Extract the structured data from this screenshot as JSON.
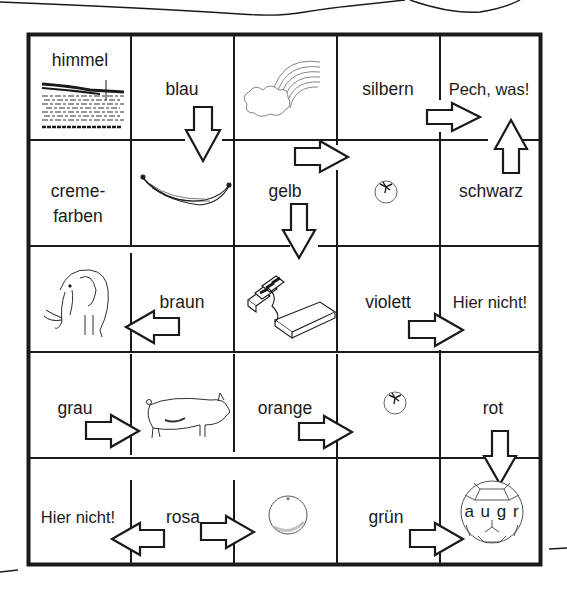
{
  "worksheet": {
    "grid": {
      "rows": 5,
      "cols": 5,
      "cells": [
        [
          {
            "label": "himmel",
            "picture": "water-landscape"
          },
          {
            "label": "blau",
            "picture": null
          },
          {
            "label": null,
            "picture": "rainbow-cloud"
          },
          {
            "label": "silbern",
            "picture": null
          },
          {
            "label": "Pech, was!",
            "picture": null
          }
        ],
        [
          {
            "label": "creme-\nfarben",
            "picture": null
          },
          {
            "label": null,
            "picture": "banana"
          },
          {
            "label": "gelb",
            "picture": null
          },
          {
            "label": null,
            "picture": "tomato"
          },
          {
            "label": "schwarz",
            "picture": null
          }
        ],
        [
          {
            "label": null,
            "picture": "elephant"
          },
          {
            "label": "braun",
            "picture": null
          },
          {
            "label": null,
            "picture": "chocolate-bar"
          },
          {
            "label": "violett",
            "picture": null
          },
          {
            "label": "Hier nicht!",
            "picture": null
          }
        ],
        [
          {
            "label": "grau",
            "picture": null
          },
          {
            "label": null,
            "picture": "pig"
          },
          {
            "label": "orange",
            "picture": null
          },
          {
            "label": null,
            "picture": "tomato"
          },
          {
            "label": "rot",
            "picture": null
          }
        ],
        [
          {
            "label": "Hier nicht!",
            "picture": null
          },
          {
            "label": "rosa",
            "picture": null
          },
          {
            "label": null,
            "picture": "orange-fruit"
          },
          {
            "label": "grün",
            "picture": null
          },
          {
            "label": null,
            "picture": "football"
          }
        ]
      ]
    },
    "labels": {
      "r0c0": "himmel",
      "r0c1": "blau",
      "r0c3": "silbern",
      "r0c4": "Pech, was!",
      "r1c0_line1": "creme-",
      "r1c0_line2": "farben",
      "r1c2": "gelb",
      "r1c4": "schwarz",
      "r2c1": "braun",
      "r2c3": "violett",
      "r2c4": "Hier nicht!",
      "r3c0": "grau",
      "r3c2": "orange",
      "r3c4": "rot",
      "r4c0": "Hier nicht!",
      "r4c1": "rosa",
      "r4c3": "grün"
    },
    "football_letters": "a u g r",
    "arrows": [
      {
        "from": "blau",
        "direction": "down"
      },
      {
        "from": "gelb",
        "direction": "right"
      },
      {
        "from": "gelb",
        "direction": "down"
      },
      {
        "from": "silbern",
        "direction": "right"
      },
      {
        "from": "schwarz",
        "direction": "up"
      },
      {
        "from": "braun",
        "direction": "left"
      },
      {
        "from": "violett",
        "direction": "right"
      },
      {
        "from": "grau",
        "direction": "right"
      },
      {
        "from": "orange",
        "direction": "right"
      },
      {
        "from": "rot",
        "direction": "down"
      },
      {
        "from": "rosa",
        "direction": "left"
      },
      {
        "from": "rosa",
        "direction": "right"
      },
      {
        "from": "grün",
        "direction": "right"
      }
    ],
    "colors": {
      "ink": "#1a1a1a",
      "paper": "#ffffff",
      "sketch": "#555555"
    }
  }
}
